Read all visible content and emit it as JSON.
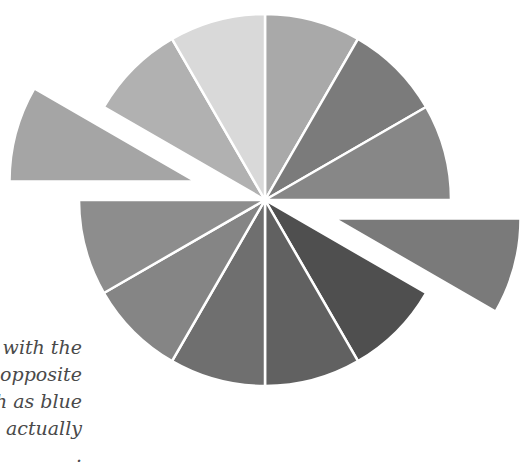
{
  "diagram": {
    "type": "color-wheel",
    "segments": 12,
    "center": [
      265,
      200
    ],
    "radius": 186,
    "explode_offset": 72,
    "separator_color": "#ffffff",
    "slices": [
      {
        "position": "12-1 o'clock",
        "color": "#a9a9a9",
        "exploded": false
      },
      {
        "position": "1-2 o'clock",
        "color": "#7b7b7b",
        "exploded": false
      },
      {
        "position": "2-3 o'clock",
        "color": "#878787",
        "exploded": false
      },
      {
        "position": "3-4 o'clock",
        "color": "#7a7a7a",
        "exploded": true
      },
      {
        "position": "4-5 o'clock",
        "color": "#4f4f4f",
        "exploded": false
      },
      {
        "position": "5-6 o'clock",
        "color": "#616161",
        "exploded": false
      },
      {
        "position": "6-7 o'clock",
        "color": "#6f6f6f",
        "exploded": false
      },
      {
        "position": "7-8 o'clock",
        "color": "#858585",
        "exploded": false
      },
      {
        "position": "8-9 o'clock",
        "color": "#8d8d8d",
        "exploded": false
      },
      {
        "position": "9-10 o'clock",
        "color": "#a5a5a5",
        "exploded": true
      },
      {
        "position": "10-11 o'clock",
        "color": "#b1b1b1",
        "exploded": false
      },
      {
        "position": "11-12 o'clock",
        "color": "#d9d9d9",
        "exploded": false
      }
    ]
  },
  "caption": {
    "lines": [
      "s with the",
      "t opposite",
      "ch as blue",
      "e actually",
      "   .   "
    ]
  }
}
